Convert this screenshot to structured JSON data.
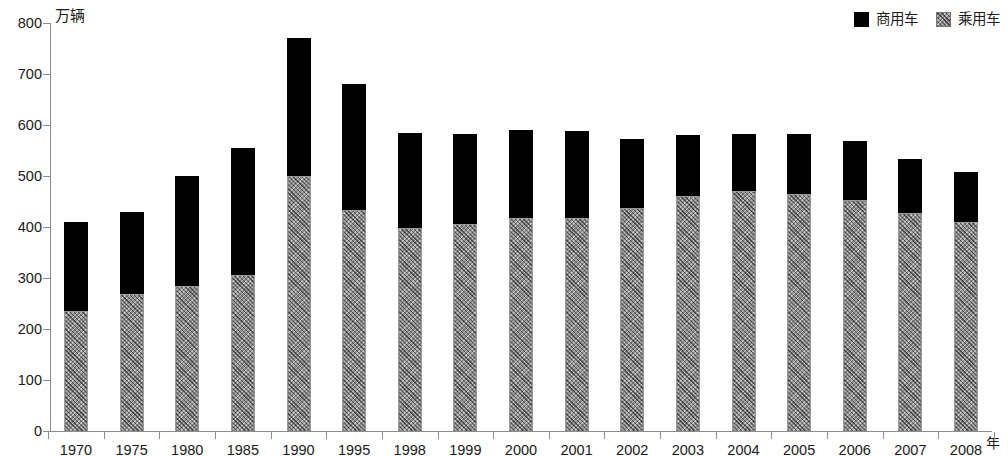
{
  "chart_data": {
    "type": "bar",
    "stacked": true,
    "title": "",
    "xlabel": "年",
    "ylabel": "万辆",
    "ylim": [
      0,
      800
    ],
    "ytick_step": 100,
    "yticks": [
      0,
      100,
      200,
      300,
      400,
      500,
      600,
      700,
      800
    ],
    "grid": false,
    "legend_position": "top-right",
    "categories": [
      "1970",
      "1975",
      "1980",
      "1985",
      "1990",
      "1995",
      "1998",
      "1999",
      "2000",
      "2001",
      "2002",
      "2003",
      "2004",
      "2005",
      "2006",
      "2007",
      "2008"
    ],
    "series": [
      {
        "name": "乘用车",
        "color": "#8c8c8c",
        "pattern": "diagonal-hatch",
        "values": [
          235,
          268,
          285,
          305,
          500,
          433,
          398,
          405,
          418,
          418,
          437,
          461,
          470,
          465,
          452,
          427,
          410
        ]
      },
      {
        "name": "商用车",
        "color": "#000000",
        "pattern": "solid",
        "values": [
          174,
          162,
          215,
          250,
          270,
          247,
          187,
          177,
          172,
          170,
          136,
          119,
          113,
          118,
          116,
          106,
          98
        ]
      }
    ],
    "totals": [
      409,
      430,
      500,
      555,
      770,
      680,
      585,
      582,
      590,
      588,
      573,
      580,
      583,
      583,
      568,
      533,
      508
    ]
  },
  "legend": {
    "items": [
      {
        "label": "商用车",
        "swatch": "black-square-icon",
        "style": "commercial"
      },
      {
        "label": "乘用车",
        "swatch": "hatched-square-icon",
        "style": "passenger"
      }
    ]
  },
  "axes": {
    "y_unit_label": "万辆",
    "x_unit_label": "年"
  }
}
